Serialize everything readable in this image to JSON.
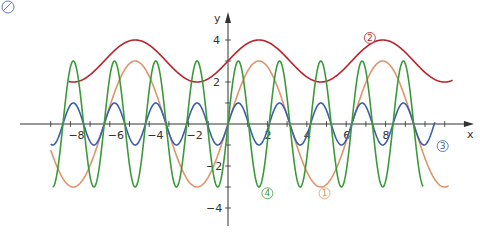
{
  "chart_data": {
    "type": "line",
    "title": "",
    "xlabel": "x",
    "ylabel": "y",
    "xlim": [
      -10.5,
      12.3
    ],
    "ylim": [
      -4.8,
      4.6
    ],
    "grid": false,
    "x_ticks": [
      -8,
      -6,
      -4,
      -2,
      2,
      4,
      6,
      8
    ],
    "x_tick_labels": [
      "-8",
      "-6",
      "-4",
      "-2",
      "2",
      "4",
      "6",
      "8"
    ],
    "y_ticks": [
      4,
      2,
      -2,
      -4
    ],
    "y_tick_labels": [
      "4",
      "2",
      "−2",
      "−4"
    ],
    "series": [
      {
        "name": "①",
        "formula": "3*sin(x)",
        "color": "#e0946a",
        "domain": [
          -9,
          11.2
        ],
        "label_pos": [
          4.9,
          -3.3
        ]
      },
      {
        "name": "②",
        "formula": "3+sin(x)",
        "color": "#b8232a",
        "domain": [
          -8.1,
          11.4
        ],
        "label_pos": [
          7.2,
          4.1
        ]
      },
      {
        "name": "③",
        "formula": "sin(3*x)",
        "color": "#3b5eab",
        "domain": [
          -9,
          10.5
        ],
        "label_pos": [
          10.9,
          -1.05
        ]
      },
      {
        "name": "④",
        "formula": "3*sin(3*x)",
        "color": "#3a9a3a",
        "domain": [
          -8.9,
          9.9
        ],
        "label_pos": [
          2.0,
          -3.3
        ]
      }
    ]
  }
}
